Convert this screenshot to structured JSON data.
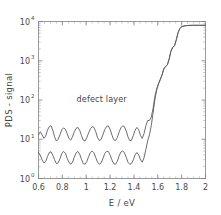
{
  "chart_data": {
    "type": "line",
    "title": "",
    "xlabel": "E / eV",
    "ylabel": "PDS - signal",
    "xlim": [
      0.6,
      2.0
    ],
    "ylim": [
      1,
      10000
    ],
    "yscale": "log",
    "xscale": "linear",
    "grid": false,
    "legend": null,
    "xticks": [
      0.6,
      0.8,
      1.0,
      1.2,
      1.4,
      1.6,
      1.8,
      2.0
    ],
    "xticklabels": [
      "0.6",
      "0.8",
      "1",
      "1.2",
      "1.4",
      "1.6",
      "1.8",
      "2"
    ],
    "yticks": [
      1,
      10,
      100,
      1000,
      10000
    ],
    "yticklabels": [
      "10",
      "10",
      "10",
      "10",
      "10"
    ],
    "ytick_exponents": [
      "0",
      "1",
      "2",
      "3",
      "4"
    ],
    "annotations": [
      {
        "text": "defect layer",
        "x": 1.13,
        "y": 90
      }
    ],
    "series": [
      {
        "name": "defect layer",
        "comment": "upper fringed curve, higher sub-gap absorption",
        "x": [
          0.6,
          0.615,
          0.63,
          0.645,
          0.66,
          0.675,
          0.69,
          0.705,
          0.72,
          0.735,
          0.75,
          0.765,
          0.78,
          0.795,
          0.81,
          0.825,
          0.84,
          0.855,
          0.87,
          0.885,
          0.9,
          0.915,
          0.93,
          0.945,
          0.96,
          0.975,
          0.99,
          1.005,
          1.02,
          1.035,
          1.05,
          1.065,
          1.08,
          1.095,
          1.11,
          1.125,
          1.14,
          1.155,
          1.17,
          1.185,
          1.2,
          1.215,
          1.23,
          1.245,
          1.26,
          1.275,
          1.29,
          1.305,
          1.32,
          1.335,
          1.35,
          1.365,
          1.38,
          1.395,
          1.41,
          1.425,
          1.44,
          1.455,
          1.47,
          1.485,
          1.5,
          1.515,
          1.53,
          1.545,
          1.56,
          1.575,
          1.59,
          1.605,
          1.62,
          1.635,
          1.65,
          1.665,
          1.68,
          1.695,
          1.71,
          1.725,
          1.74,
          1.755,
          1.77,
          1.785,
          1.8,
          1.83,
          1.86,
          1.9,
          1.95,
          2.0
        ],
        "y": [
          13.0,
          15.5,
          13.0,
          10.5,
          12.0,
          17.0,
          21.0,
          22.0,
          17.0,
          11.5,
          9.0,
          10.0,
          13.0,
          17.5,
          19.5,
          18.0,
          14.0,
          10.5,
          9.5,
          11.5,
          15.5,
          19.0,
          20.0,
          17.0,
          12.5,
          9.5,
          9.0,
          11.0,
          14.5,
          18.5,
          21.0,
          20.0,
          15.5,
          11.0,
          9.2,
          10.0,
          13.0,
          17.5,
          21.0,
          22.0,
          18.0,
          13.0,
          9.8,
          9.2,
          11.0,
          15.0,
          19.5,
          22.0,
          21.0,
          16.5,
          11.5,
          9.2,
          9.5,
          12.5,
          17.0,
          20.0,
          17.5,
          12.5,
          10.5,
          14.0,
          22.0,
          30.0,
          30.0,
          36.0,
          60.0,
          120.0,
          190.0,
          260.0,
          330.0,
          430.0,
          620.0,
          720.0,
          780.0,
          1100.0,
          1750.0,
          2200.0,
          2400.0,
          3400.0,
          5200.0,
          6600.0,
          7400.0,
          7800.0,
          7950.0,
          8000.0,
          8000.0,
          8000.0
        ]
      },
      {
        "name": "reference",
        "comment": "lower fringed curve, lower sub-gap absorption",
        "x": [
          0.6,
          0.615,
          0.63,
          0.645,
          0.66,
          0.675,
          0.69,
          0.705,
          0.72,
          0.735,
          0.75,
          0.765,
          0.78,
          0.795,
          0.81,
          0.825,
          0.84,
          0.855,
          0.87,
          0.885,
          0.9,
          0.915,
          0.93,
          0.945,
          0.96,
          0.975,
          0.99,
          1.005,
          1.02,
          1.035,
          1.05,
          1.065,
          1.08,
          1.095,
          1.11,
          1.125,
          1.14,
          1.155,
          1.17,
          1.185,
          1.2,
          1.215,
          1.23,
          1.245,
          1.26,
          1.275,
          1.29,
          1.305,
          1.32,
          1.335,
          1.35,
          1.365,
          1.38,
          1.395,
          1.41,
          1.425,
          1.44,
          1.455,
          1.47,
          1.485,
          1.5,
          1.515,
          1.53,
          1.545,
          1.56,
          1.575,
          1.59,
          1.605,
          1.62,
          1.635,
          1.65,
          1.665,
          1.68,
          1.695,
          1.71,
          1.725,
          1.74,
          1.755,
          1.77,
          1.785,
          1.8,
          1.83,
          1.86,
          1.9,
          1.95,
          2.0
        ],
        "y": [
          4.6,
          3.9,
          3.0,
          2.5,
          2.7,
          3.6,
          4.6,
          4.8,
          3.9,
          3.0,
          2.4,
          2.5,
          3.2,
          4.3,
          4.9,
          4.4,
          3.3,
          2.6,
          2.3,
          2.6,
          3.5,
          4.5,
          4.9,
          4.2,
          3.1,
          2.4,
          2.3,
          2.7,
          3.6,
          4.6,
          5.0,
          4.5,
          3.4,
          2.6,
          2.3,
          2.5,
          3.2,
          4.3,
          4.9,
          4.9,
          4.0,
          3.0,
          2.4,
          2.3,
          2.7,
          3.7,
          4.7,
          5.0,
          4.6,
          3.5,
          2.6,
          2.3,
          2.4,
          3.0,
          4.0,
          4.6,
          4.0,
          3.0,
          2.6,
          3.4,
          5.5,
          9.0,
          13.0,
          22.0,
          45.0,
          100.0,
          175.0,
          250.0,
          325.0,
          425.0,
          615.0,
          715.0,
          780.0,
          1100.0,
          1750.0,
          2200.0,
          2400.0,
          3400.0,
          5200.0,
          6600.0,
          7400.0,
          7800.0,
          7950.0,
          8000.0,
          8000.0,
          8000.0
        ]
      }
    ]
  },
  "axes": {
    "y_label_text": "PDS - signal",
    "x_label_text": "E / eV",
    "y_mantissa": "10"
  }
}
